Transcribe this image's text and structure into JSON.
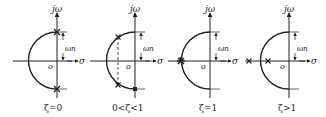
{
  "diagram": {
    "axis_labels": {
      "vertical": "jω",
      "horizontal": "σ",
      "origin": "o",
      "radius": "ωn"
    },
    "colors": {
      "line": "#222222",
      "background": "#ffffff"
    },
    "panels": [
      {
        "id": "undamped",
        "caption": "ζ=0",
        "pole_description": "two poles on imaginary axis at ±jωn"
      },
      {
        "id": "underdamped",
        "caption": "0<ζ<1",
        "pole_description": "complex conjugate poles on semicircle, dashed line joining them"
      },
      {
        "id": "critically-damped",
        "caption": "ζ=1",
        "pole_description": "double real pole at -ωn"
      },
      {
        "id": "overdamped",
        "caption": "ζ>1",
        "pole_description": "two distinct real poles on negative real axis"
      }
    ]
  }
}
